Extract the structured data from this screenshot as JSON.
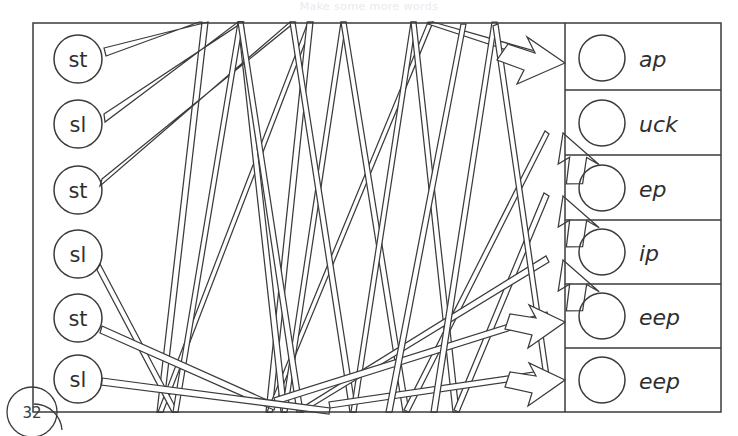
{
  "worksheet": {
    "title_faded": "Make some more words",
    "page_number": "32",
    "ink_color": "#3b3b3b",
    "background_color": "#ffffff",
    "frame": {
      "x": 33,
      "y": 23,
      "width": 688,
      "height": 389,
      "divider_x": 565
    }
  },
  "left_column": {
    "name": "blends",
    "circle_radius": 24,
    "items": [
      {
        "label": "st",
        "cx": 78,
        "cy": 59
      },
      {
        "label": "sl",
        "cx": 78,
        "cy": 124
      },
      {
        "label": "st",
        "cx": 78,
        "cy": 190
      },
      {
        "label": "sl",
        "cx": 78,
        "cy": 254
      },
      {
        "label": "st",
        "cx": 78,
        "cy": 318
      },
      {
        "label": "sl",
        "cx": 78,
        "cy": 379
      }
    ]
  },
  "right_column": {
    "name": "word-endings",
    "circle_radius": 23,
    "row_height": 64.8,
    "items": [
      {
        "label": "ap",
        "cy": 58
      },
      {
        "label": "uck",
        "cy": 123
      },
      {
        "label": "ep",
        "cy": 188
      },
      {
        "label": "ip",
        "cy": 252
      },
      {
        "label": "eep",
        "cy": 316
      },
      {
        "label": "eep",
        "cy": 380
      }
    ]
  },
  "connectors": {
    "style": "double-stroke-outline-with-open-arrowhead",
    "arrow_targets": [
      {
        "x": 565,
        "y": 63
      },
      {
        "x": 562,
        "y": 142
      },
      {
        "x": 562,
        "y": 203
      },
      {
        "x": 562,
        "y": 268
      },
      {
        "x": 562,
        "y": 324
      },
      {
        "x": 562,
        "y": 382
      }
    ],
    "paths": [
      {
        "from": "st-1",
        "points": [
          [
            104,
            52
          ],
          [
            205,
            25
          ],
          [
            160,
            412
          ],
          [
            310,
            25
          ],
          [
            268,
            412
          ],
          [
            430,
            25
          ],
          [
            556,
            62
          ]
        ]
      },
      {
        "from": "sl-2",
        "points": [
          [
            104,
            118
          ],
          [
            240,
            25
          ],
          [
            283,
            412
          ],
          [
            343,
            25
          ],
          [
            405,
            412
          ],
          [
            498,
            120
          ],
          [
            556,
            140
          ]
        ]
      },
      {
        "from": "st-3",
        "points": [
          [
            102,
            183
          ],
          [
            292,
            25
          ],
          [
            352,
            412
          ],
          [
            413,
            25
          ],
          [
            455,
            412
          ],
          [
            520,
            180
          ],
          [
            556,
            201
          ]
        ]
      },
      {
        "from": "sl-4",
        "points": [
          [
            100,
            268
          ],
          [
            175,
            412
          ],
          [
            240,
            25
          ],
          [
            300,
            412
          ],
          [
            470,
            330
          ],
          [
            556,
            266
          ]
        ]
      },
      {
        "from": "st-5",
        "points": [
          [
            102,
            330
          ],
          [
            270,
            405
          ],
          [
            440,
            392
          ],
          [
            556,
            322
          ]
        ]
      },
      {
        "from": "sl-6",
        "points": [
          [
            102,
            382
          ],
          [
            320,
            408
          ],
          [
            470,
            398
          ],
          [
            556,
            380
          ]
        ]
      }
    ]
  }
}
